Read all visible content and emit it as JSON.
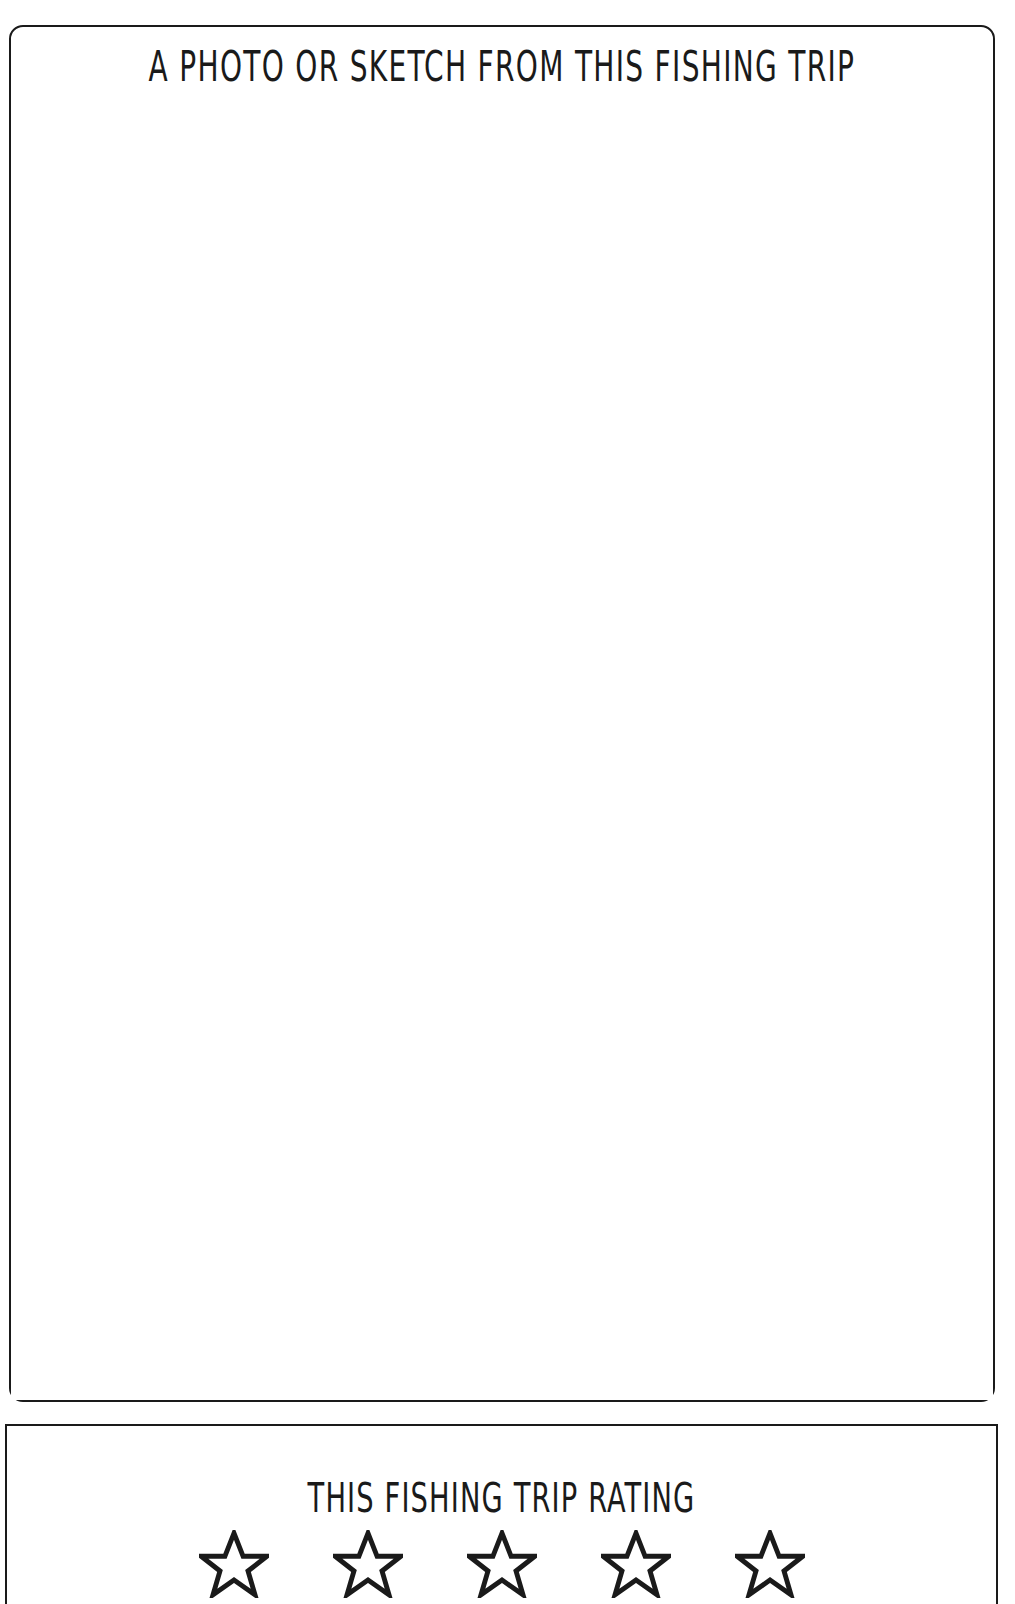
{
  "page": {
    "background_color": "#ffffff",
    "ink_color": "#1a1a1a",
    "document_type": "fishing-log-journal-page"
  },
  "photo_section": {
    "title": "A PHOTO OR SKETCH FROM THIS FISHING TRIP",
    "canvas_placeholder": "",
    "canvas_is_blank": true
  },
  "rating_section": {
    "title": "THIS FISHING TRIP RATING",
    "star_count": 5,
    "stars_filled": 0,
    "stars": [
      {
        "index": 1,
        "filled": false,
        "label": "rating-star-1"
      },
      {
        "index": 2,
        "filled": false,
        "label": "rating-star-2"
      },
      {
        "index": 3,
        "filled": false,
        "label": "rating-star-3"
      },
      {
        "index": 4,
        "filled": false,
        "label": "rating-star-4"
      },
      {
        "index": 5,
        "filled": false,
        "label": "rating-star-5"
      }
    ]
  }
}
